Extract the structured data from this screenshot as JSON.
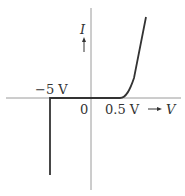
{
  "diagram": {
    "type": "diode-iv-characteristic",
    "axes": {
      "x_label": "V",
      "x_arrow": "→",
      "y_label": "I",
      "y_arrow": "↑",
      "origin_label": "0"
    },
    "annotations": {
      "breakdown_voltage": "−5 V",
      "threshold_voltage": "0.5 V"
    },
    "colors": {
      "axis": "#9a9a9a",
      "curve": "#333333",
      "text": "#333333"
    }
  }
}
